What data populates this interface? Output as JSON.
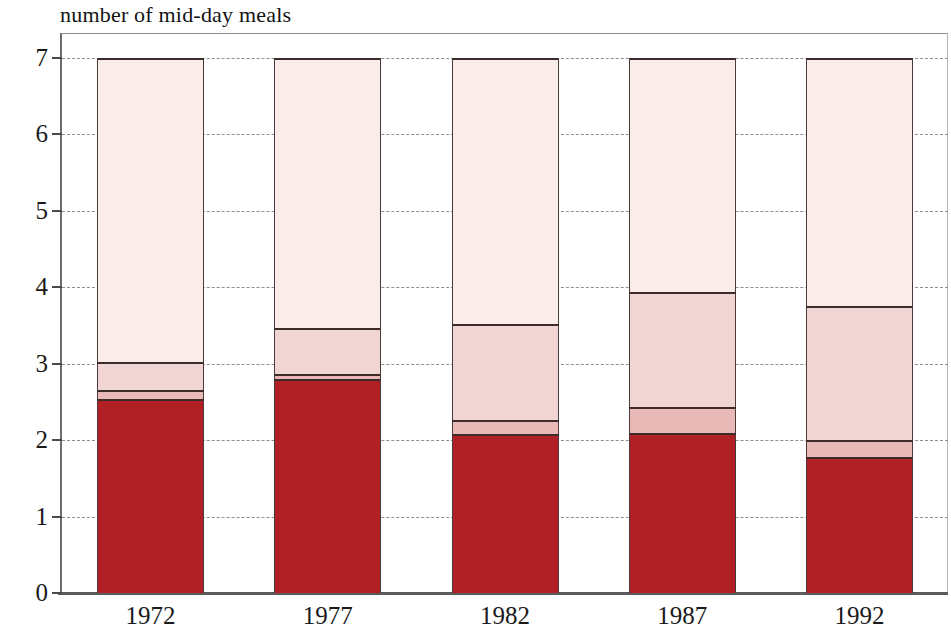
{
  "chart_data": {
    "type": "bar",
    "subtype": "stacked-bar",
    "title": "number of mid-day meals",
    "xlabel": "",
    "ylabel": "number of mid-day meals",
    "ylim": [
      0,
      7
    ],
    "yticks": [
      0,
      1,
      2,
      3,
      4,
      5,
      6,
      7
    ],
    "ytick_labels": [
      "0",
      "1",
      "2",
      "3",
      "4",
      "5",
      "6",
      "7"
    ],
    "grid": true,
    "legend": "none",
    "categories": [
      "1972",
      "1977",
      "1982",
      "1987",
      "1992"
    ],
    "series": [
      {
        "name": "segment-1",
        "color": "#b02025",
        "values": [
          2.54,
          2.8,
          2.08,
          2.09,
          1.78
        ]
      },
      {
        "name": "segment-2",
        "color": "#e8b9b6",
        "values": [
          0.12,
          0.07,
          0.18,
          0.34,
          0.22
        ]
      },
      {
        "name": "segment-3",
        "color": "#f0d5d2",
        "values": [
          0.36,
          0.6,
          1.26,
          1.51,
          1.75
        ]
      },
      {
        "name": "segment-4",
        "color": "#f9ece9",
        "values": [
          3.98,
          3.53,
          3.48,
          3.06,
          3.25
        ]
      }
    ],
    "cumulative_tops": [
      [
        2.54,
        2.66,
        3.02,
        7.0
      ],
      [
        2.8,
        2.87,
        3.47,
        7.0
      ],
      [
        2.08,
        2.26,
        3.52,
        7.0
      ],
      [
        2.09,
        2.43,
        3.94,
        7.0
      ],
      [
        1.78,
        2.0,
        3.75,
        7.0
      ]
    ],
    "colors": {
      "segment_1": "#b02025",
      "segment_2": "#e8b9b6",
      "segment_3": "#f0d5d2",
      "segment_4": "#f9ece9",
      "outline": "#3b2b2b",
      "axis": "#5b5b5b",
      "grid": "#8f8f8f",
      "text": "#1a1a1a",
      "background": "#ffffff"
    }
  },
  "axes": {
    "y_labels": [
      "7",
      "6",
      "5",
      "4",
      "3",
      "2",
      "1",
      "0"
    ],
    "x_labels": [
      "1972",
      "1977",
      "1982",
      "1987",
      "1992"
    ]
  }
}
